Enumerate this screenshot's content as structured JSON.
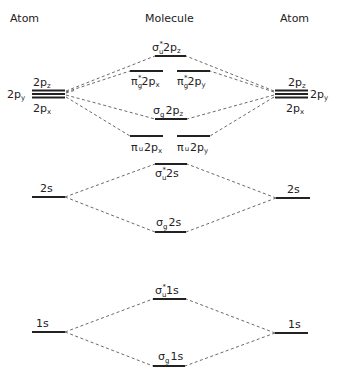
{
  "headers": {
    "left": "Atom",
    "center": "Molecule",
    "right": "Atom"
  },
  "atom_left": {
    "p_labels": {
      "pz": "2pz",
      "py": "2py",
      "px": "2px"
    },
    "s2": "2s",
    "s1": "1s"
  },
  "atom_right": {
    "p_labels": {
      "pz": "2pz",
      "py": "2py",
      "px": "2px"
    },
    "s2": "2s",
    "s1": "1s"
  },
  "molecule": {
    "sigma_u_star_2pz": {
      "greek": "σ",
      "sub": "u",
      "star": "*",
      "orbital": "2p",
      "orb_sub": "z"
    },
    "pi_g_star_2px": {
      "greek": "π",
      "sub": "g",
      "star": "*",
      "orbital": "2p",
      "orb_sub": "x"
    },
    "pi_g_star_2py": {
      "greek": "π",
      "sub": "g",
      "star": "*",
      "orbital": "2p",
      "orb_sub": "y"
    },
    "sigma_g_2pz": {
      "greek": "σ",
      "sub": "g",
      "star": "",
      "orbital": "2p",
      "orb_sub": "z"
    },
    "pi_u_2px": {
      "greek": "π",
      "sub": "u",
      "star": "",
      "orbital": "2p",
      "orb_sub": "x"
    },
    "pi_u_2py": {
      "greek": "π",
      "sub": "u",
      "star": "",
      "orbital": "2p",
      "orb_sub": "y"
    },
    "sigma_u_star_2s": {
      "greek": "σ",
      "sub": "u",
      "star": "*",
      "orbital": "2s",
      "orb_sub": ""
    },
    "sigma_g_2s": {
      "greek": "σ",
      "sub": "g",
      "star": "",
      "orbital": "2s",
      "orb_sub": ""
    },
    "sigma_u_star_1s": {
      "greek": "σ",
      "sub": "u",
      "star": "*",
      "orbital": "1s",
      "orb_sub": ""
    },
    "sigma_g_1s": {
      "greek": "σ",
      "sub": "g",
      "star": "",
      "orbital": "1s",
      "orb_sub": ""
    }
  },
  "p_sym": "p",
  "two": "2"
}
